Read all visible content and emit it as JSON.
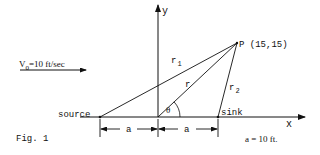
{
  "figure": {
    "caption": "Fig. 1",
    "velocity_label": "V",
    "velocity_subscript": "0",
    "velocity_value": "=10 ft/sec",
    "axis_x_label": "x",
    "axis_y_label": "y",
    "point_label": "P (15,15)",
    "source_label": "source",
    "sink_label": "sink",
    "r1_label": "r",
    "r1_sub": "1",
    "r2_label": "r",
    "r2_sub": "2",
    "r_label": "r",
    "theta_label": "θ",
    "dim_left_label": "a",
    "dim_right_label": "a",
    "a_value": "a = 10 ft."
  },
  "colors": {
    "ink": "#111111",
    "background": "#ffffff"
  }
}
